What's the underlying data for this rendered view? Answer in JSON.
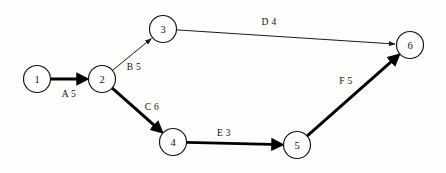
{
  "diagram": {
    "type": "activity-on-node-network",
    "background_color": "#fdfdfc",
    "stroke_color": "#111111",
    "nodes": [
      {
        "id": "1",
        "label": "1",
        "cx": 37,
        "cy": 79,
        "r": 13.5
      },
      {
        "id": "2",
        "label": "2",
        "cx": 102,
        "cy": 79,
        "r": 13.5
      },
      {
        "id": "3",
        "label": "3",
        "cx": 163,
        "cy": 29,
        "r": 13.5
      },
      {
        "id": "4",
        "label": "4",
        "cx": 173,
        "cy": 142,
        "r": 13.5
      },
      {
        "id": "5",
        "label": "5",
        "cx": 297,
        "cy": 145,
        "r": 13.5
      },
      {
        "id": "6",
        "label": "6",
        "cx": 410,
        "cy": 45,
        "r": 13.5
      }
    ],
    "edges": [
      {
        "id": "edge-a",
        "activity": "A",
        "duration": "5",
        "label": "A 5",
        "from": "1",
        "to": "2",
        "style": "thick",
        "label_x": 69,
        "label_y": 94
      },
      {
        "id": "edge-b",
        "activity": "B",
        "duration": "5",
        "label": "B 5",
        "from": "2",
        "to": "3",
        "style": "thin",
        "label_x": 134,
        "label_y": 67
      },
      {
        "id": "edge-c",
        "activity": "C",
        "duration": "6",
        "label": "C 6",
        "from": "2",
        "to": "4",
        "style": "thick",
        "label_x": 152,
        "label_y": 107
      },
      {
        "id": "edge-d",
        "activity": "D",
        "duration": "4",
        "label": "D 4",
        "from": "3",
        "to": "6",
        "style": "thin",
        "label_x": 269,
        "label_y": 22
      },
      {
        "id": "edge-e",
        "activity": "E",
        "duration": "3",
        "label": "E 3",
        "from": "4",
        "to": "5",
        "style": "thick",
        "label_x": 224,
        "label_y": 133
      },
      {
        "id": "edge-f",
        "activity": "F",
        "duration": "5",
        "label": "F 5",
        "from": "5",
        "to": "6",
        "style": "thick",
        "label_x": 346,
        "label_y": 81
      }
    ]
  }
}
